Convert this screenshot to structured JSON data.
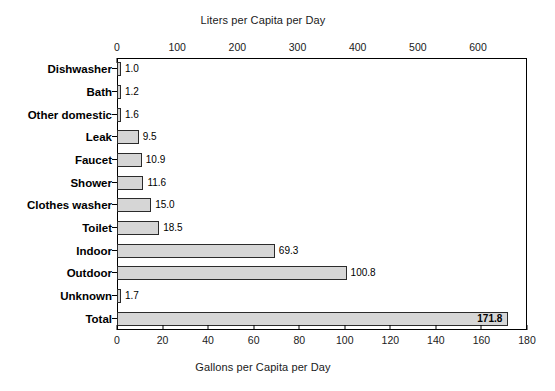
{
  "chart_data": {
    "type": "bar",
    "orientation": "horizontal",
    "title": "",
    "categories": [
      "Dishwasher",
      "Bath",
      "Other domestic",
      "Leak",
      "Faucet",
      "Shower",
      "Clothes washer",
      "Toilet",
      "Indoor",
      "Outdoor",
      "Unknown",
      "Total"
    ],
    "values": [
      1.0,
      1.2,
      1.6,
      9.5,
      10.9,
      11.6,
      15.0,
      18.5,
      69.3,
      100.8,
      1.7,
      171.8
    ],
    "value_labels": [
      "1.0",
      "1.2",
      "1.6",
      "9.5",
      "10.9",
      "11.6",
      "15.0",
      "18.5",
      "69.3",
      "100.8",
      "1.7",
      "171.8"
    ],
    "xlabel": "Gallons per Capita per Day",
    "xlabel_top": "Liters per Capita per Day",
    "ylabel": "",
    "xlim": [
      0,
      180
    ],
    "xlim_top": [
      0,
      681.4
    ],
    "xticks": [
      0,
      20,
      40,
      60,
      80,
      100,
      120,
      140,
      160,
      180
    ],
    "xtick_labels": [
      "0",
      "20",
      "40",
      "60",
      "80",
      "100",
      "120",
      "140",
      "160",
      "180"
    ],
    "xticks_top": [
      0,
      100,
      200,
      300,
      400,
      500,
      600
    ],
    "xtick_labels_top": [
      "0",
      "100",
      "200",
      "300",
      "400",
      "500",
      "600"
    ],
    "grid": false,
    "legend": null,
    "bar_fill_color": "#d6d6d6",
    "bar_edge_color": "#2b2b2b",
    "background_color": "#ffffff",
    "text_color": "#000000"
  },
  "axes": {
    "top_title": "Liters per Capita per Day",
    "bottom_title": "Gallons per Capita per Day"
  }
}
